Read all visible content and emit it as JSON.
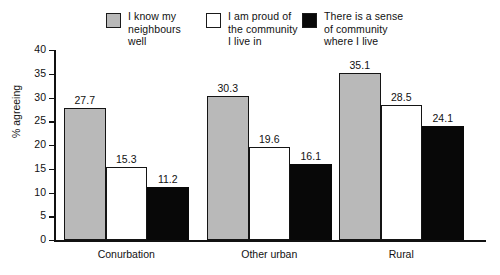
{
  "chart_data": {
    "type": "bar",
    "title": "",
    "xlabel": "",
    "ylabel": "% agreeing",
    "ylim": [
      0,
      40
    ],
    "yticks": [
      0,
      5,
      10,
      15,
      20,
      25,
      30,
      35,
      40
    ],
    "ytick_labels": [
      "0",
      "5",
      "10",
      "15",
      "20",
      "25",
      "30",
      "35",
      "40"
    ],
    "grid": false,
    "legend_position": "top",
    "categories": [
      "Conurbation",
      "Other urban",
      "Rural"
    ],
    "series": [
      {
        "name": "I know my\nneighbours well",
        "color": "#b9b9b9",
        "values": [
          27.7,
          30.3,
          35.1
        ],
        "value_labels": [
          "27.7",
          "30.3",
          "35.1"
        ]
      },
      {
        "name": "I am proud of\nthe community\nI live in",
        "color": "#ffffff",
        "values": [
          15.3,
          19.6,
          28.5
        ],
        "value_labels": [
          "15.3",
          "19.6",
          "28.5"
        ]
      },
      {
        "name": "There is a sense\nof community\nwhere I live",
        "color": "#080808",
        "values": [
          11.2,
          16.1,
          24.1
        ],
        "value_labels": [
          "11.2",
          "16.1",
          "24.1"
        ]
      }
    ]
  },
  "colors": {
    "series_gray": "#b9b9b9",
    "series_white": "#ffffff",
    "series_black": "#080808",
    "axis": "#111111",
    "background": "#ffffff"
  }
}
